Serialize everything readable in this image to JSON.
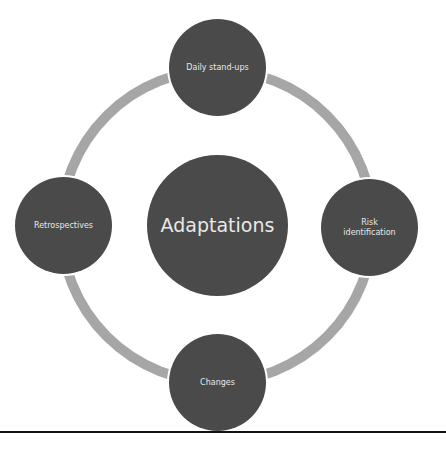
{
  "diagram": {
    "type": "cycle",
    "center": {
      "label": "Adaptations"
    },
    "nodes": [
      {
        "label": "Daily stand-ups",
        "position": "top"
      },
      {
        "label": "Risk identification",
        "position": "right"
      },
      {
        "label": "Changes",
        "position": "bottom"
      },
      {
        "label": "Retrospectives",
        "position": "left"
      }
    ],
    "colors": {
      "node_fill": "#4a4a4a",
      "node_text": "#e8e8e8",
      "ring": "#a6a6a6",
      "background": "#ffffff",
      "rule": "#111111"
    }
  }
}
